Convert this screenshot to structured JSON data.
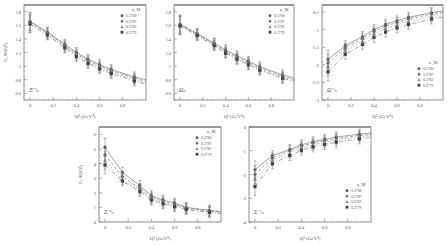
{
  "figure": {
    "legend_title": "κ_M",
    "x_axis_label": "Q² (GeV²)"
  },
  "chart_data": [
    {
      "type": "line",
      "title": "",
      "panel_label": "Ξ⁻ₙ",
      "xlabel": "Q² (GeV²)",
      "ylabel": "G_M(Q²)",
      "x": [
        0,
        0.15,
        0.3,
        0.4,
        0.5,
        0.6,
        0.7,
        0.9
      ],
      "xticks": [
        "0",
        "0.2",
        "0.4",
        "0.6",
        "0.8"
      ],
      "yticks": [
        "0.6",
        "0.8",
        "1",
        "1.2",
        "1.4",
        "1.6",
        "1.8"
      ],
      "ylim": [
        0.5,
        1.9
      ],
      "legend": [
        "0.3760",
        "0.3787",
        "0.3762",
        "0.3779"
      ],
      "series": [
        {
          "name": "0.3760",
          "values": [
            1.66,
            1.5,
            1.32,
            1.2,
            1.1,
            1.02,
            0.95,
            0.84
          ]
        },
        {
          "name": "0.3787",
          "values": [
            1.65,
            1.49,
            1.3,
            1.18,
            1.08,
            1.0,
            0.93,
            0.82
          ]
        },
        {
          "name": "0.3762",
          "values": [
            1.63,
            1.47,
            1.28,
            1.16,
            1.06,
            0.98,
            0.91,
            0.8
          ]
        },
        {
          "name": "0.3779",
          "values": [
            1.62,
            1.46,
            1.27,
            1.14,
            1.04,
            0.96,
            0.89,
            0.78
          ]
        }
      ]
    },
    {
      "type": "line",
      "title": "",
      "panel_label": "Ωₙ",
      "xlabel": "Q² (GeV²)",
      "ylabel": "",
      "x": [
        0,
        0.15,
        0.3,
        0.4,
        0.5,
        0.6,
        0.7,
        0.9
      ],
      "xticks": [
        "0",
        "0.2",
        "0.4",
        "0.6",
        "0.8"
      ],
      "yticks": [
        "0.6",
        "0.8",
        "1",
        "1.2",
        "1.4",
        "1.6",
        "1.8"
      ],
      "ylim": [
        0.5,
        1.9
      ],
      "legend": [
        "0.3760",
        "0.3787",
        "0.3762",
        "0.3779"
      ],
      "series": [
        {
          "name": "0.3760",
          "values": [
            1.62,
            1.48,
            1.34,
            1.24,
            1.15,
            1.07,
            0.99,
            0.87
          ]
        },
        {
          "name": "0.3787",
          "values": [
            1.61,
            1.47,
            1.33,
            1.22,
            1.13,
            1.05,
            0.97,
            0.85
          ]
        },
        {
          "name": "0.3762",
          "values": [
            1.6,
            1.46,
            1.31,
            1.2,
            1.11,
            1.03,
            0.95,
            0.83
          ]
        },
        {
          "name": "0.3779",
          "values": [
            1.59,
            1.45,
            1.3,
            1.19,
            1.1,
            1.02,
            0.94,
            0.82
          ]
        }
      ]
    },
    {
      "type": "line",
      "title": "",
      "panel_label": "Ω⁻ₙ",
      "xlabel": "Q² (GeV²)",
      "ylabel": "",
      "x": [
        0,
        0.15,
        0.3,
        0.4,
        0.5,
        0.6,
        0.7,
        0.9
      ],
      "xticks": [
        "0",
        "0.2",
        "0.4",
        "0.6",
        "0.8"
      ],
      "yticks": [
        "-3",
        "-2.5",
        "-2",
        "-1.5",
        "-1",
        "-0.5"
      ],
      "ylim": [
        -3,
        -0.3
      ],
      "legend": [
        "0.3760",
        "0.3787",
        "0.3762",
        "0.3779"
      ],
      "series": [
        {
          "name": "0.3760",
          "values": [
            -1.85,
            -1.45,
            -1.2,
            -1.0,
            -0.85,
            -0.75,
            -0.65,
            -0.52
          ]
        },
        {
          "name": "0.3787",
          "values": [
            -1.95,
            -1.52,
            -1.25,
            -1.05,
            -0.9,
            -0.8,
            -0.7,
            -0.56
          ]
        },
        {
          "name": "0.3762",
          "values": [
            -2.05,
            -1.6,
            -1.32,
            -1.12,
            -0.97,
            -0.86,
            -0.76,
            -0.62
          ]
        },
        {
          "name": "0.3779",
          "values": [
            -2.2,
            -1.7,
            -1.42,
            -1.22,
            -1.07,
            -0.95,
            -0.85,
            -0.7
          ]
        }
      ]
    },
    {
      "type": "line",
      "title": "",
      "panel_label": "Σ⁺ₙ",
      "xlabel": "Q² (GeV²)",
      "ylabel": "G_M(Q²)",
      "x": [
        0,
        0.15,
        0.3,
        0.4,
        0.5,
        0.6,
        0.7,
        0.9
      ],
      "xticks": [
        "0",
        "0.2",
        "0.4",
        "0.6",
        "0.8"
      ],
      "yticks": [
        "0",
        "1",
        "2",
        "3",
        "4",
        "5",
        "6"
      ],
      "ylim": [
        0,
        6.5
      ],
      "legend": [
        "0.3760",
        "0.3787",
        "0.3762",
        "0.3779"
      ],
      "series": [
        {
          "name": "0.3760",
          "values": [
            5.1,
            3.4,
            2.5,
            1.8,
            1.5,
            1.3,
            1.0,
            0.8
          ]
        },
        {
          "name": "0.3787",
          "values": [
            4.6,
            3.1,
            2.3,
            1.7,
            1.4,
            1.2,
            0.95,
            0.75
          ]
        },
        {
          "name": "0.3762",
          "values": [
            4.2,
            2.9,
            2.2,
            1.6,
            1.3,
            1.1,
            0.9,
            0.7
          ]
        },
        {
          "name": "0.3779",
          "values": [
            3.9,
            2.8,
            2.1,
            1.5,
            1.25,
            1.05,
            0.85,
            0.65
          ]
        }
      ]
    },
    {
      "type": "line",
      "title": "",
      "panel_label": "Σ⁻ₙ",
      "xlabel": "Q² (GeV²)",
      "ylabel": "",
      "x": [
        0,
        0.15,
        0.3,
        0.4,
        0.5,
        0.6,
        0.7,
        0.9
      ],
      "xticks": [
        "0",
        "0.2",
        "0.4",
        "0.6",
        "0.8"
      ],
      "yticks": [
        "-4",
        "-3",
        "-2",
        "-1",
        "0"
      ],
      "ylim": [
        -4,
        0
      ],
      "legend": [
        "0.3760",
        "0.3787",
        "0.3762",
        "0.3779"
      ],
      "series": [
        {
          "name": "0.3760",
          "values": [
            -1.8,
            -1.2,
            -0.95,
            -0.75,
            -0.62,
            -0.52,
            -0.42,
            -0.3
          ]
        },
        {
          "name": "0.3787",
          "values": [
            -2.0,
            -1.3,
            -1.0,
            -0.8,
            -0.68,
            -0.58,
            -0.48,
            -0.36
          ]
        },
        {
          "name": "0.3762",
          "values": [
            -2.2,
            -1.4,
            -1.1,
            -0.88,
            -0.75,
            -0.65,
            -0.55,
            -0.42
          ]
        },
        {
          "name": "0.3779",
          "values": [
            -2.5,
            -1.55,
            -1.2,
            -0.98,
            -0.84,
            -0.74,
            -0.64,
            -0.5
          ]
        }
      ]
    }
  ]
}
